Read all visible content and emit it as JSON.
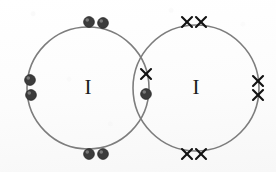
{
  "figure": {
    "kind": "dot-and-cross-diagram",
    "molecule_label": "I2",
    "background_color": "#fdfdfd",
    "ring_color": "#7d7d7d",
    "dot_color": "#3c3c3c",
    "cross_color": "#121212",
    "width": 276,
    "height": 172
  },
  "atoms": [
    {
      "id": "left-atom",
      "symbol": "I",
      "symbol_x": 88,
      "symbol_y": 89,
      "electron_mark": "dot",
      "shell": {
        "cx": 88,
        "cy": 88,
        "r": 61
      }
    },
    {
      "id": "right-atom",
      "symbol": "I",
      "symbol_x": 196,
      "symbol_y": 89,
      "electron_mark": "cross",
      "shell": {
        "cx": 196,
        "cy": 88,
        "r": 63
      }
    }
  ],
  "electron_groups": [
    {
      "name": "left-lone-pair-top",
      "mark": "dot",
      "owner": "left-atom",
      "count": 2,
      "points": [
        {
          "x": 89,
          "y": 22
        },
        {
          "x": 103,
          "y": 23
        }
      ]
    },
    {
      "name": "left-lone-pair-left",
      "mark": "dot",
      "owner": "left-atom",
      "count": 2,
      "points": [
        {
          "x": 30,
          "y": 80
        },
        {
          "x": 31,
          "y": 95
        }
      ]
    },
    {
      "name": "left-lone-pair-bottom",
      "mark": "dot",
      "owner": "left-atom",
      "count": 2,
      "points": [
        {
          "x": 89,
          "y": 154
        },
        {
          "x": 103,
          "y": 154
        }
      ]
    },
    {
      "name": "shared-bonding-pair-dot",
      "mark": "dot",
      "owner": "left-atom",
      "count": 1,
      "points": [
        {
          "x": 146,
          "y": 94
        }
      ]
    },
    {
      "name": "shared-bonding-pair-cross",
      "mark": "cross",
      "owner": "right-atom",
      "count": 1,
      "points": [
        {
          "x": 146,
          "y": 74
        }
      ]
    },
    {
      "name": "right-lone-pair-top",
      "mark": "cross",
      "owner": "right-atom",
      "count": 2,
      "points": [
        {
          "x": 187,
          "y": 22
        },
        {
          "x": 201,
          "y": 22
        }
      ]
    },
    {
      "name": "right-lone-pair-right",
      "mark": "cross",
      "owner": "right-atom",
      "count": 2,
      "points": [
        {
          "x": 258,
          "y": 81
        },
        {
          "x": 258,
          "y": 95
        }
      ]
    },
    {
      "name": "right-lone-pair-bottom",
      "mark": "cross",
      "owner": "right-atom",
      "count": 2,
      "points": [
        {
          "x": 187,
          "y": 154
        },
        {
          "x": 201,
          "y": 154
        }
      ]
    }
  ],
  "geometry": {
    "dot_radius": 5.4,
    "cross_arm": 5.0
  }
}
